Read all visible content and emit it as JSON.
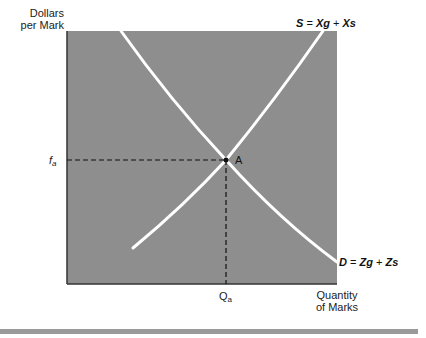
{
  "axes": {
    "y_label_line1": "Dollars",
    "y_label_line2": "per Mark",
    "x_label_line1": "Quantity",
    "x_label_line2": "of Marks"
  },
  "curves": {
    "supply": {
      "name": "S",
      "eq_lhs": "S",
      "eq_op": "=",
      "term1": "Xg",
      "plus": "+",
      "term2": "Xs"
    },
    "demand": {
      "name": "D",
      "eq_lhs": "D",
      "eq_op": "=",
      "term1": "Zg",
      "plus": "+",
      "term2": "Zs"
    }
  },
  "equilibrium": {
    "point_label": "A",
    "price_label": "f",
    "price_subscript": "a",
    "quantity_label": "Q",
    "quantity_subscript": "a"
  },
  "colors": {
    "plot_fill": "#8e8e8e",
    "curve": "#ffffff",
    "axis": "#333333",
    "dashed": "#111111",
    "bottom_rule": "#9a9a9a"
  }
}
